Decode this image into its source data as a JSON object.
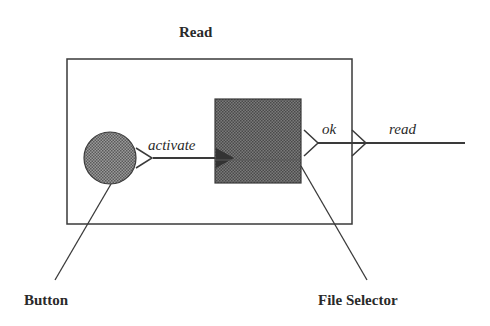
{
  "diagram": {
    "title": "Read",
    "edges": {
      "activate": "activate",
      "ok": "ok",
      "read": "read"
    },
    "callouts": {
      "button": "Button",
      "file_selector": "File Selector"
    }
  },
  "colors": {
    "stroke": "#3a3a3a",
    "fill_dark": "#6e6e6e",
    "fill_circle": "#8a8a8a",
    "background": "#ffffff"
  }
}
